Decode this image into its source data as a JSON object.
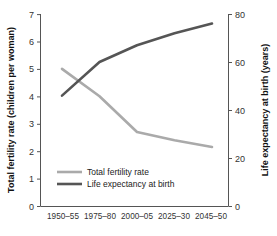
{
  "chart_data": {
    "type": "line",
    "title": "",
    "xlabel": "",
    "categories": [
      "1950–55",
      "1975–80",
      "2000–05",
      "2025–30",
      "2045–50"
    ],
    "grid": false,
    "legend_position": "inside-bottom-left",
    "axes": {
      "left": {
        "label": "Total fertility rate (children per woman)",
        "ticks": [
          "0",
          "1",
          "2",
          "3",
          "4",
          "5",
          "6",
          "7"
        ],
        "tick_values": [
          0,
          1,
          2,
          3,
          4,
          5,
          6,
          7
        ],
        "lim": [
          0,
          7
        ]
      },
      "right": {
        "label": "Life expectancy at birth (years)",
        "ticks": [
          "0",
          "20",
          "40",
          "60",
          "80"
        ],
        "tick_values": [
          0,
          20,
          40,
          60,
          80
        ],
        "lim": [
          0,
          80
        ]
      }
    },
    "series": [
      {
        "name": "Total fertility rate",
        "axis": "left",
        "color": "#aaaaaa",
        "values": [
          5.0,
          4.0,
          2.7,
          2.4,
          2.15
        ]
      },
      {
        "name": "Life expectancy at birth",
        "axis": "right",
        "color": "#555555",
        "values": [
          46,
          60,
          67,
          72,
          76
        ]
      }
    ]
  },
  "legend": {
    "items": [
      {
        "label": "Total fertility rate",
        "color": "#aaaaaa"
      },
      {
        "label": "Life expectancy at birth",
        "color": "#555555"
      }
    ]
  },
  "colors": {
    "fertility": "#aaaaaa",
    "life_expectancy": "#555555",
    "axis": "#555555",
    "text": "#222222",
    "background": "#ffffff"
  }
}
